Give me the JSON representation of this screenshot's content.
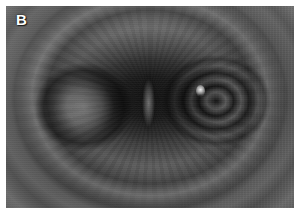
{
  "figure": {
    "panel_label": "B",
    "modality": "endoscopy",
    "color_mode": "grayscale",
    "caption_text": "",
    "alt_description": "Grayscale endoscopic view of a tubular lumen with concentric mucosal folds converging toward a narrow central slit-like opening"
  },
  "image": {
    "width_px": 300,
    "height_px": 217,
    "frame": {
      "border_color": "#ffffff",
      "border_px": 6,
      "photo_left_px": 6,
      "photo_top_px": 6,
      "photo_width_px": 288,
      "photo_height_px": 202
    }
  },
  "appearance": {
    "background_color": "#ffffff",
    "mucosa_mid_gray": "#8a8a8a",
    "mucosa_light_gray": "#9a9a9a",
    "lumen_dark": "#101010",
    "highlight_white": "#ffffff",
    "label_color": "#ffffff"
  },
  "features": [
    {
      "name": "outer-mucosal-ring",
      "label": ""
    },
    {
      "name": "mid-fold-band",
      "label": ""
    },
    {
      "name": "lumen-cavity",
      "label": ""
    },
    {
      "name": "left-fold-lobe",
      "label": ""
    },
    {
      "name": "right-fold-lobe",
      "label": ""
    },
    {
      "name": "central-slit",
      "label": ""
    },
    {
      "name": "specular-highlight",
      "label": ""
    }
  ]
}
